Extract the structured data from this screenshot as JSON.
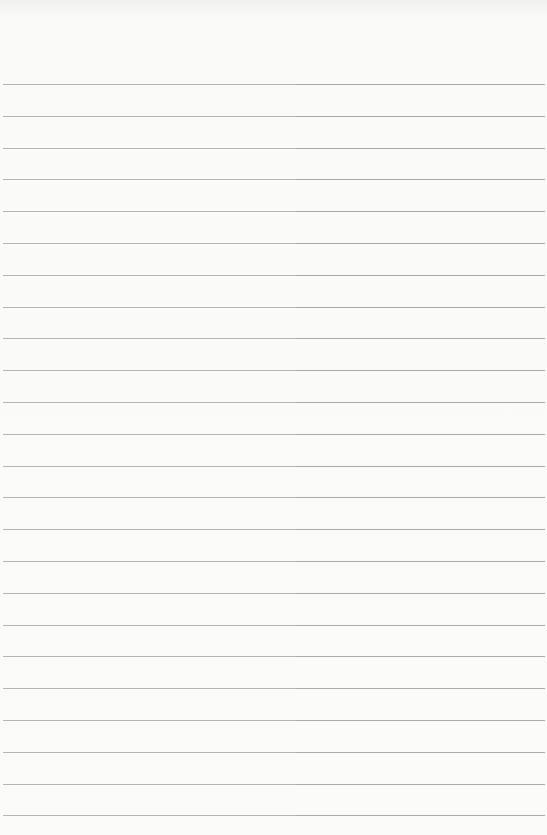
{
  "paper": {
    "type": "lined-paper",
    "background_color": "#fafaf9",
    "line_color": "#b5b5b5",
    "line_count": 24,
    "first_line_y": 84,
    "line_spacing": 31.8
  }
}
